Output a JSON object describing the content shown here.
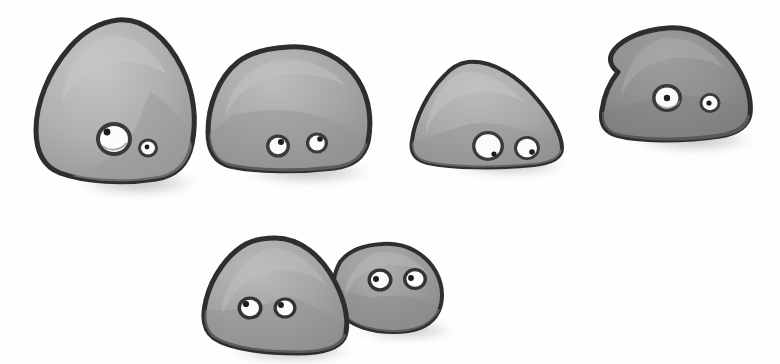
{
  "artwork": {
    "title": "Six grey cartoon rocks with googly eyes",
    "medium": "watercolor and ink sketch",
    "background_color": "#fefefe",
    "canvas": {
      "width": 780,
      "height": 364
    },
    "palette": {
      "outline": "#2f2f2f",
      "rock_light": "#b0b0b0",
      "rock_mid": "#a3a3a3",
      "rock_dark": "#8f8f8f",
      "rock_darkest": "#878787",
      "shade": "#8a8a8a",
      "highlight": "#c4c4c4",
      "shadow": "#b8b8b8",
      "eye_white": "#fbfbfb",
      "eye_rim": "#3a3a3a",
      "pupil": "#1c1c1c"
    },
    "row_labels": {
      "top": "top row of four rocks",
      "bottom": "bottom pair of touching rocks"
    }
  },
  "rocks": [
    {
      "id": "rock-1",
      "name": "large triangular rock",
      "row": "top",
      "position": {
        "x": 30,
        "y": 18,
        "width": 165,
        "height": 165
      },
      "fill": "#b0b0b0",
      "shade": "#9a9a9a",
      "outline_width": 5,
      "eyes": [
        {
          "name": "left-eye",
          "size": "large",
          "pupil_direction": "upper-left"
        },
        {
          "name": "right-eye",
          "size": "small",
          "pupil_direction": "center"
        }
      ]
    },
    {
      "id": "rock-2",
      "name": "rounded dome rock",
      "row": "top",
      "position": {
        "x": 208,
        "y": 45,
        "width": 160,
        "height": 130
      },
      "fill": "#a8a8a8",
      "shade": "#949494",
      "outline_width": 5,
      "eyes": [
        {
          "name": "left-eye",
          "size": "medium",
          "pupil_direction": "upper-right"
        },
        {
          "name": "right-eye",
          "size": "medium",
          "pupil_direction": "upper-right"
        }
      ]
    },
    {
      "id": "rock-3",
      "name": "low wedge rock",
      "row": "top",
      "position": {
        "x": 410,
        "y": 58,
        "width": 155,
        "height": 110
      },
      "fill": "#ababab",
      "shade": "#969696",
      "outline_width": 4,
      "eyes": [
        {
          "name": "left-eye",
          "size": "large",
          "pupil_direction": "lower-right"
        },
        {
          "name": "right-eye",
          "size": "large",
          "pupil_direction": "lower-right"
        }
      ]
    },
    {
      "id": "rock-4",
      "name": "dark notched rock",
      "row": "top",
      "position": {
        "x": 594,
        "y": 25,
        "width": 160,
        "height": 115
      },
      "fill": "#8f8f8f",
      "shade": "#828282",
      "outline_width": 5,
      "eyes": [
        {
          "name": "left-eye",
          "size": "large",
          "pupil_direction": "center"
        },
        {
          "name": "right-eye",
          "size": "small",
          "pupil_direction": "center"
        }
      ]
    },
    {
      "id": "rock-5",
      "name": "front left rock of pair",
      "row": "bottom",
      "position": {
        "x": 205,
        "y": 238,
        "width": 145,
        "height": 115
      },
      "fill": "#a6a6a6",
      "shade": "#929292",
      "outline_width": 5,
      "eyes": [
        {
          "name": "left-eye",
          "size": "medium",
          "pupil_direction": "upper-left"
        },
        {
          "name": "right-eye",
          "size": "medium",
          "pupil_direction": "upper-left"
        }
      ]
    },
    {
      "id": "rock-6",
      "name": "back right rock of pair",
      "row": "bottom",
      "position": {
        "x": 336,
        "y": 245,
        "width": 105,
        "height": 90
      },
      "fill": "#9b9b9b",
      "shade": "#8b8b8b",
      "outline_width": 4,
      "eyes": [
        {
          "name": "left-eye",
          "size": "medium",
          "pupil_direction": "left"
        },
        {
          "name": "right-eye",
          "size": "medium",
          "pupil_direction": "left"
        }
      ]
    }
  ],
  "shadows": [
    {
      "name": "shadow-rock-1",
      "cx": 130,
      "cy": 184,
      "rx": 62,
      "ry": 13
    },
    {
      "name": "shadow-rock-2",
      "cx": 300,
      "cy": 173,
      "rx": 66,
      "ry": 12
    },
    {
      "name": "shadow-rock-3",
      "cx": 500,
      "cy": 166,
      "rx": 62,
      "ry": 11
    },
    {
      "name": "shadow-rock-4",
      "cx": 686,
      "cy": 141,
      "rx": 64,
      "ry": 12
    },
    {
      "name": "shadow-rock-5",
      "cx": 285,
      "cy": 352,
      "rx": 64,
      "ry": 12
    },
    {
      "name": "shadow-rock-6",
      "cx": 398,
      "cy": 331,
      "rx": 50,
      "ry": 10
    }
  ]
}
